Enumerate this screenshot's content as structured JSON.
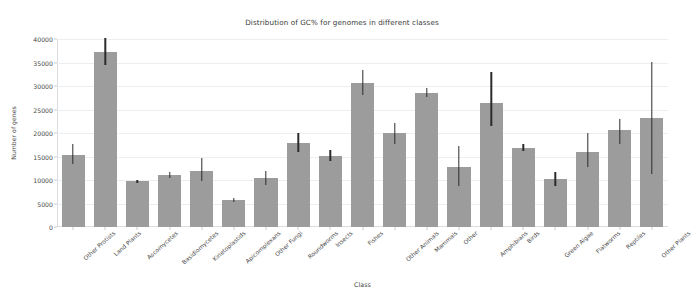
{
  "chart_data": {
    "type": "bar",
    "title": "Distribution of GC% for genomes in different classes",
    "xlabel": "Class",
    "ylabel": "Number of genes",
    "ylim": [
      0,
      40000
    ],
    "yticks": [
      0,
      5000,
      10000,
      15000,
      20000,
      25000,
      30000,
      35000,
      40000
    ],
    "ytick_labels": [
      "0",
      "5000",
      "10000",
      "15000",
      "20000",
      "25000",
      "30000",
      "35000",
      "40000"
    ],
    "grid": true,
    "legend": null,
    "bar_color": "#9c9c9c",
    "errorbar_color": "#2b2b2b",
    "categories": [
      "Other Protists",
      "Land Plants",
      "Ascomycetes",
      "Basidiomycetes",
      "Kinetoplastids",
      "Apicomplexans",
      "Other Fungi",
      "Roundworms",
      "Insects",
      "Fishes",
      "Other Animals",
      "Mammals",
      "Other",
      "Amphibians",
      "Birds",
      "Green Algae",
      "Flatworms",
      "Reptiles",
      "Other Plants"
    ],
    "values": [
      15300,
      37200,
      9700,
      11100,
      12000,
      5800,
      10400,
      17900,
      15200,
      30600,
      20000,
      28500,
      12800,
      26300,
      16900,
      10200,
      16000,
      20700,
      23200
    ],
    "err_low": [
      13300,
      34400,
      9400,
      10500,
      9700,
      5400,
      8900,
      15900,
      14100,
      28000,
      17700,
      27600,
      8700,
      21500,
      16200,
      8800,
      12700,
      17700,
      11200
    ],
    "err_high": [
      17700,
      40200,
      9950,
      11700,
      14600,
      6100,
      11900,
      20000,
      16300,
      33300,
      22100,
      29600,
      17200,
      32900,
      17600,
      11800,
      20000,
      22900,
      35100
    ]
  }
}
